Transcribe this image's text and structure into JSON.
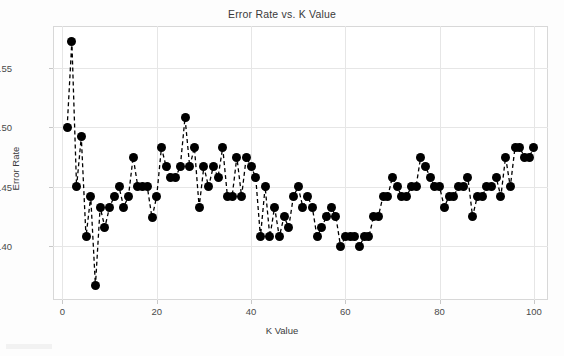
{
  "chart_data": {
    "type": "line",
    "title": "Error Rate vs. K Value",
    "xlabel": "K Value",
    "ylabel": "Error Rate",
    "xlim": [
      -2,
      103
    ],
    "ylim": [
      0.355,
      0.585
    ],
    "grid": true,
    "legend": "none",
    "marker": "filled-circle",
    "linestyle": "dashed",
    "color": "#000000",
    "xticks": [
      0,
      20,
      40,
      60,
      80,
      100
    ],
    "xtick_labels": [
      "0",
      "20",
      "40",
      "60",
      "80",
      "100"
    ],
    "yticks": [
      0.4,
      0.45,
      0.5,
      0.55
    ],
    "ytick_labels": [
      "0.40",
      "0.45",
      "0.50",
      "0.55"
    ],
    "x": [
      1,
      2,
      3,
      4,
      5,
      6,
      7,
      8,
      9,
      10,
      11,
      12,
      13,
      14,
      15,
      16,
      17,
      18,
      19,
      20,
      21,
      22,
      23,
      24,
      25,
      26,
      27,
      28,
      29,
      30,
      31,
      32,
      33,
      34,
      35,
      36,
      37,
      38,
      39,
      40,
      41,
      42,
      43,
      44,
      45,
      46,
      47,
      48,
      49,
      50,
      51,
      52,
      53,
      54,
      55,
      56,
      57,
      58,
      59,
      60,
      61,
      62,
      63,
      64,
      65,
      66,
      67,
      68,
      69,
      70,
      71,
      72,
      73,
      74,
      75,
      76,
      77,
      78,
      79,
      80,
      81,
      82,
      83,
      84,
      85,
      86,
      87,
      88,
      89,
      90,
      91,
      92,
      93,
      94,
      95,
      96,
      97,
      98,
      99,
      100
    ],
    "y": [
      0.5,
      0.572,
      0.45,
      0.492,
      0.408,
      0.442,
      0.367,
      0.433,
      0.416,
      0.433,
      0.442,
      0.45,
      0.433,
      0.442,
      0.475,
      0.45,
      0.45,
      0.45,
      0.424,
      0.442,
      0.483,
      0.467,
      0.458,
      0.458,
      0.467,
      0.508,
      0.467,
      0.483,
      0.433,
      0.467,
      0.45,
      0.467,
      0.458,
      0.483,
      0.442,
      0.442,
      0.475,
      0.442,
      0.475,
      0.467,
      0.458,
      0.408,
      0.45,
      0.408,
      0.433,
      0.408,
      0.425,
      0.416,
      0.442,
      0.45,
      0.433,
      0.442,
      0.433,
      0.408,
      0.416,
      0.425,
      0.433,
      0.425,
      0.4,
      0.408,
      0.408,
      0.408,
      0.4,
      0.408,
      0.408,
      0.425,
      0.425,
      0.442,
      0.442,
      0.458,
      0.45,
      0.442,
      0.442,
      0.45,
      0.45,
      0.475,
      0.467,
      0.458,
      0.45,
      0.45,
      0.433,
      0.442,
      0.442,
      0.45,
      0.45,
      0.458,
      0.425,
      0.442,
      0.442,
      0.45,
      0.45,
      0.458,
      0.442,
      0.475,
      0.45,
      0.483,
      0.483,
      0.475,
      0.475,
      0.483
    ],
    "ymin_value": 0.367,
    "ymin_k": 7,
    "ymax_value": 0.572,
    "ymax_k": 2
  },
  "axes": {
    "x_title": "K Value",
    "y_title": "Error Rate"
  }
}
